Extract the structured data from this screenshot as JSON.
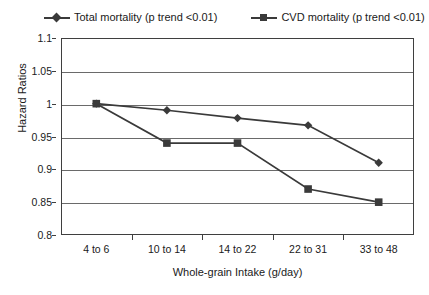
{
  "chart_data": {
    "type": "line",
    "title": "",
    "xlabel": "Whole-grain Intake (g/day)",
    "ylabel": "Hazard Ratios",
    "categories": [
      "4 to 6",
      "10 to 14",
      "14 to 22",
      "22 to 31",
      "33 to 48"
    ],
    "series": [
      {
        "name": "Total mortality (p trend <0.01)",
        "marker": "diamond",
        "color": "#3a3a3a",
        "values": [
          1.0,
          0.99,
          0.978,
          0.967,
          0.91
        ]
      },
      {
        "name": "CVD mortality (p trend <0.01)",
        "marker": "square",
        "color": "#3a3a3a",
        "values": [
          1.0,
          0.94,
          0.94,
          0.87,
          0.85
        ]
      }
    ],
    "ylim": [
      0.8,
      1.1
    ],
    "yticks": [
      "0.8",
      "0.85",
      "0.9",
      "0.95",
      "1",
      "1.05",
      "1.1"
    ],
    "ytick_values": [
      0.8,
      0.85,
      0.9,
      0.95,
      1.0,
      1.05,
      1.1
    ],
    "grid": true,
    "legend_position": "top"
  },
  "legend": {
    "entries": [
      {
        "label": "Total mortality (p trend <0.01)",
        "marker": "diamond"
      },
      {
        "label": "CVD mortality (p trend <0.01)",
        "marker": "square"
      }
    ]
  }
}
